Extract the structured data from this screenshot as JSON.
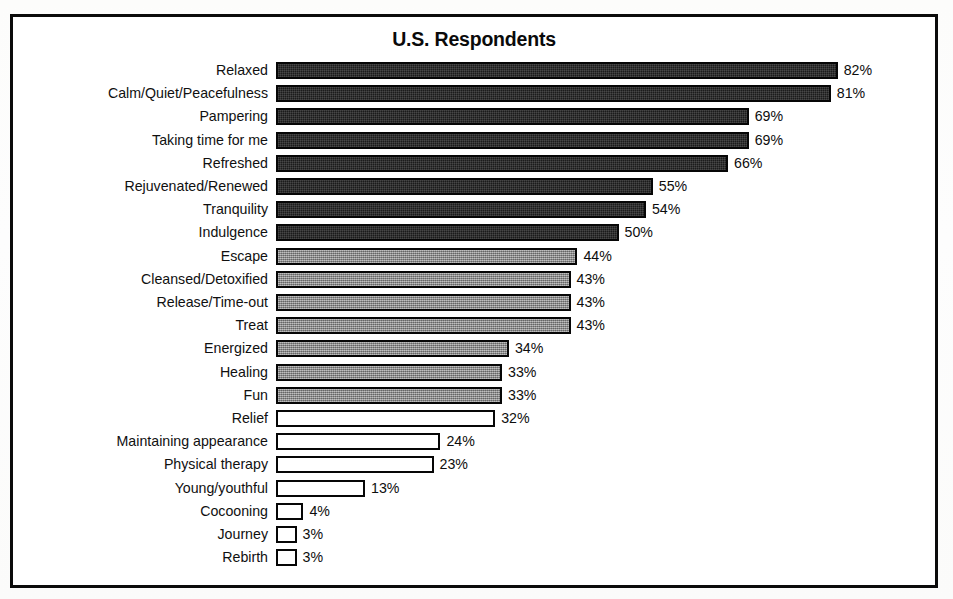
{
  "chart": {
    "title": "U.S. Respondents"
  },
  "chart_data": {
    "type": "bar",
    "orientation": "horizontal",
    "title": "U.S. Respondents",
    "xlabel": "",
    "ylabel": "",
    "xlim": [
      0,
      100
    ],
    "grid": false,
    "legend": null,
    "value_suffix": "%",
    "categories": [
      "Relaxed",
      "Calm/Quiet/Peacefulness",
      "Pampering",
      "Taking time for me",
      "Refreshed",
      "Rejuvenated/Renewed",
      "Tranquility",
      "Indulgence",
      "Escape",
      "Cleansed/Detoxified",
      "Release/Time-out",
      "Treat",
      "Energized",
      "Healing",
      "Fun",
      "Relief",
      "Maintaining appearance",
      "Physical therapy",
      "Young/youthful",
      "Cocooning",
      "Journey",
      "Rebirth"
    ],
    "values": [
      82,
      81,
      69,
      69,
      66,
      55,
      54,
      50,
      44,
      43,
      43,
      43,
      34,
      33,
      33,
      32,
      24,
      23,
      13,
      4,
      3,
      3
    ],
    "value_labels": [
      "82%",
      "81%",
      "69%",
      "69%",
      "66%",
      "55%",
      "54%",
      "50%",
      "44%",
      "43%",
      "43%",
      "43%",
      "34%",
      "33%",
      "33%",
      "32%",
      "24%",
      "23%",
      "13%",
      "4%",
      "3%",
      "3%"
    ],
    "bar_shades": [
      "dark",
      "dark",
      "dark",
      "dark",
      "dark",
      "dark",
      "dark",
      "dark",
      "gray",
      "gray",
      "gray",
      "gray",
      "gray",
      "gray",
      "gray",
      "white",
      "white",
      "white",
      "white",
      "white",
      "white",
      "white"
    ],
    "colors": {
      "dark": "#1b1b1b",
      "gray": "#8d8d8d",
      "white": "#ffffff",
      "outline": "#060606",
      "text": "#0d0d0d",
      "frame": "#0b0b0b"
    }
  }
}
